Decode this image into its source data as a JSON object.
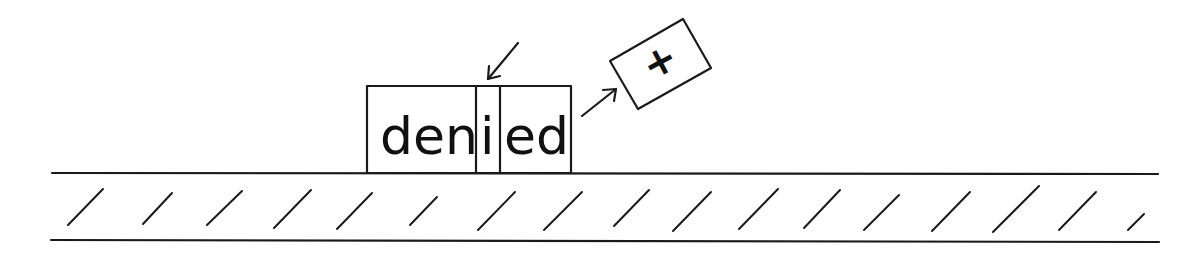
{
  "diagram": {
    "title": "",
    "word": "denied",
    "segments": [
      {
        "label": "den",
        "role": "root"
      },
      {
        "label": "i",
        "role": "changed-letter"
      },
      {
        "label": "ed",
        "role": "suffix"
      }
    ],
    "suffix_box": {
      "label": "+",
      "meaning": "addition"
    },
    "colors": {
      "ink": "#1a1a1a",
      "background": "#ffffff"
    }
  }
}
